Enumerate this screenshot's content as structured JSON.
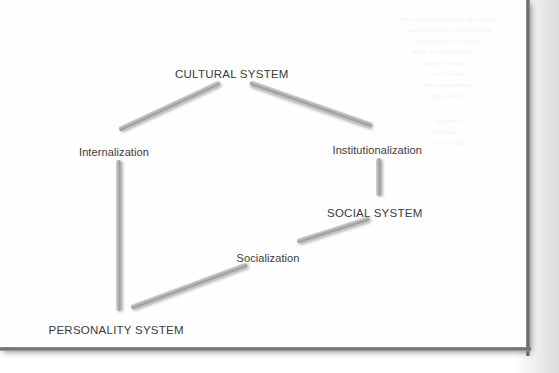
{
  "page": {
    "background_color": "#fefefe",
    "surround_color": "#dcdcdc",
    "edge_shadow_color": "#575757"
  },
  "diagram": {
    "type": "cycle-diagram",
    "title": "",
    "connector_color": "#a9a9a9",
    "label_color": "#3b3b3b",
    "nodes": [
      {
        "id": "cultural",
        "label": "CULTURAL SYSTEM",
        "style": "caps",
        "x": 232,
        "y": 68
      },
      {
        "id": "personality",
        "label": "PERSONALITY SYSTEM",
        "style": "caps",
        "x": 116,
        "y": 324
      },
      {
        "id": "social",
        "label": "SOCIAL SYSTEM",
        "style": "caps",
        "x": 375,
        "y": 207
      }
    ],
    "edge_labels": [
      {
        "id": "internalization",
        "label": "Internalization",
        "style": "mixed",
        "x": 114,
        "y": 146
      },
      {
        "id": "institutionalization",
        "label": "Institutionalization",
        "style": "mixed",
        "x": 377,
        "y": 144
      },
      {
        "id": "socialization",
        "label": "Socialization",
        "style": "mixed",
        "x": 268,
        "y": 252
      }
    ],
    "connectors": [
      {
        "id": "cultural-to-internalization",
        "from": "internalization",
        "to": "cultural",
        "x1": 119,
        "y1": 129,
        "x2": 220,
        "y2": 82
      },
      {
        "id": "cultural-to-institutionalization",
        "from": "cultural",
        "to": "institutionalization",
        "x1": 250,
        "y1": 82,
        "x2": 373,
        "y2": 125
      },
      {
        "id": "internalization-to-personality",
        "from": "internalization",
        "to": "personality",
        "x1": 118,
        "y1": 160,
        "x2": 118,
        "y2": 311,
        "orientation": "vertical"
      },
      {
        "id": "institutionalization-to-social",
        "from": "institutionalization",
        "to": "social",
        "x1": 378,
        "y1": 158,
        "x2": 378,
        "y2": 196,
        "orientation": "vertical"
      },
      {
        "id": "social-to-socialization",
        "from": "social",
        "to": "socialization",
        "x1": 297,
        "y1": 241,
        "x2": 369,
        "y2": 218
      },
      {
        "id": "socialization-to-personality",
        "from": "socialization",
        "to": "personality",
        "x1": 131,
        "y1": 307,
        "x2": 247,
        "y2": 264
      }
    ]
  },
  "ghost_text": {
    "visible": true,
    "note": "illegible scan bleed-through from reverse page",
    "lines": [
      {
        "text": "the resulting pattern of social",
        "x": 400,
        "y": 14
      },
      {
        "text": "and normative expectation",
        "x": 408,
        "y": 25
      },
      {
        "text": "integration of value",
        "x": 418,
        "y": 36
      },
      {
        "text": "with the institution",
        "x": 412,
        "y": 47
      },
      {
        "text": "shared values",
        "x": 424,
        "y": 58
      },
      {
        "text": "level of the",
        "x": 430,
        "y": 69
      },
      {
        "text": "role expectation",
        "x": 420,
        "y": 80
      },
      {
        "text": "the internal",
        "x": 432,
        "y": 91
      },
      {
        "text": "system of",
        "x": 436,
        "y": 116
      },
      {
        "text": "structure",
        "x": 430,
        "y": 127
      },
      {
        "text": "the social",
        "x": 434,
        "y": 138
      }
    ]
  }
}
